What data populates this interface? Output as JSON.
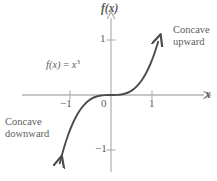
{
  "figure": {
    "axes": {
      "y_label": "f(x)",
      "x_label": "x",
      "origin_label": "0"
    },
    "ticks": {
      "y_pos_1": "1",
      "y_neg_1": "−1",
      "x_neg_1": "−1",
      "x_pos_1": "1"
    },
    "equation": {
      "fn": "f(x)",
      "eq": "=",
      "base": "x",
      "exponent": "3"
    },
    "annotations": {
      "concave_upward_line1": "Concave",
      "concave_upward_line2": "upward",
      "concave_downward_line1": "Concave",
      "concave_downward_line2": "downward"
    }
  },
  "chart_data": {
    "type": "line",
    "title": "",
    "subtitle": "",
    "xlabel": "x",
    "ylabel": "f(x)",
    "function": "f(x) = x^3",
    "xlim": [
      -1.35,
      1.25
    ],
    "ylim": [
      -1.6,
      1.5
    ],
    "xticks": [
      -1,
      0,
      1
    ],
    "xticklabels": [
      "−1",
      "0",
      "1"
    ],
    "yticks": [
      -1,
      1
    ],
    "yticklabels": [
      "−1",
      "1"
    ],
    "grid": false,
    "legend": false,
    "series": [
      {
        "name": "f(x) = x^3",
        "color": "#4c4c4c",
        "arrow_start": true,
        "arrow_end": true,
        "x": [
          -1.25,
          -1.15,
          -1.05,
          -0.95,
          -0.85,
          -0.75,
          -0.65,
          -0.55,
          -0.45,
          -0.35,
          -0.25,
          -0.15,
          -0.05,
          0.0,
          0.05,
          0.15,
          0.25,
          0.35,
          0.45,
          0.55,
          0.65,
          0.75,
          0.85,
          0.95,
          1.05,
          1.15
        ],
        "y": [
          -1.953,
          -1.521,
          -1.158,
          -0.857,
          -0.614,
          -0.422,
          -0.275,
          -0.166,
          -0.091,
          -0.043,
          -0.016,
          -0.003,
          0.0,
          0.0,
          0.0,
          0.003,
          0.016,
          0.043,
          0.091,
          0.166,
          0.275,
          0.422,
          0.614,
          0.857,
          1.158,
          1.521
        ]
      }
    ],
    "annotations": [
      {
        "text": "Concave upward",
        "x": 1.0,
        "y": 1.1
      },
      {
        "text": "Concave downward",
        "x": -1.15,
        "y": -0.45
      },
      {
        "text": "f(x) = x^3",
        "x": -0.8,
        "y": 0.6
      }
    ],
    "axis_color": "#b5b5b5",
    "text_color": "#5a5a5a"
  }
}
